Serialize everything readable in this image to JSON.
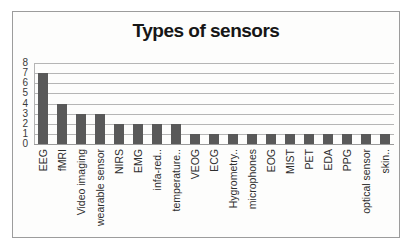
{
  "chart_data": {
    "type": "bar",
    "title": "Types of sensors",
    "categories": [
      "EEG",
      "fMRI",
      "Video imaging",
      "wearable sensor",
      "NIRS",
      "EMG",
      "infa-red..",
      "temperature..",
      "VEOG",
      "ECG",
      "Hygrometry..",
      "microphones",
      "EOG",
      "MIST",
      "PET",
      "EDA",
      "PPG",
      "optical sensor",
      "skin.."
    ],
    "values": [
      7,
      4,
      3,
      3,
      2,
      2,
      2,
      2,
      1,
      1,
      1,
      1,
      1,
      1,
      1,
      1,
      1,
      1,
      1
    ],
    "xlabel": "",
    "ylabel": "",
    "ylim": [
      0,
      8
    ],
    "yticks": [
      0,
      1,
      2,
      3,
      4,
      5,
      6,
      7,
      8
    ],
    "grid": "horizontal",
    "legend": "none",
    "colors": {
      "bar": "#595959",
      "gridline": "#b5b5b5",
      "axis_line": "#9a9a9a",
      "frame_border": "#9c9c9c",
      "title_text": "#161616",
      "tick_text": "#3a3a3a"
    }
  }
}
